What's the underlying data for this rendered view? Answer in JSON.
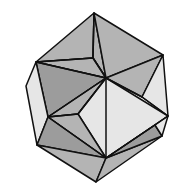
{
  "diagram": {
    "type": "polyhedron-line-drawing",
    "colors": {
      "background": "#ffffff",
      "stroke": "#111111",
      "light_face": "#e6e6e6",
      "mid_face": "#b4b4b4",
      "dark_face": "#9c9c9c"
    },
    "vertices": {
      "T": [
        94,
        13
      ],
      "IU": [
        93,
        58
      ],
      "LU": [
        36,
        62
      ],
      "RU": [
        163,
        55
      ],
      "C": [
        106,
        78
      ],
      "FL": [
        26,
        86
      ],
      "IR": [
        142,
        97
      ],
      "LM": [
        48,
        117
      ],
      "IL": [
        78,
        114
      ],
      "R": [
        168,
        116
      ],
      "RL": [
        155,
        125
      ],
      "RB": [
        162,
        136
      ],
      "LL": [
        37,
        145
      ],
      "BC": [
        106,
        158
      ],
      "B": [
        96,
        182
      ]
    },
    "faces": [
      {
        "name": "top-left-face",
        "pts": [
          "T",
          "LU",
          "IU"
        ],
        "shade": "mid_face"
      },
      {
        "name": "top-center-face",
        "pts": [
          "T",
          "IU",
          "C"
        ],
        "shade": "mid_face"
      },
      {
        "name": "top-right-face",
        "pts": [
          "T",
          "C",
          "RU"
        ],
        "shade": "mid_face"
      },
      {
        "name": "upper-left-face",
        "pts": [
          "LU",
          "IU",
          "C"
        ],
        "shade": "mid_face"
      },
      {
        "name": "left-mid-face",
        "pts": [
          "LU",
          "C",
          "LM"
        ],
        "shade": "dark_face"
      },
      {
        "name": "center-left-face",
        "pts": [
          "C",
          "IL",
          "LM"
        ],
        "shade": "mid_face"
      },
      {
        "name": "right-upper-face",
        "pts": [
          "C",
          "RU",
          "IR"
        ],
        "shade": "mid_face"
      },
      {
        "name": "right-side-face",
        "pts": [
          "RU",
          "R",
          "IR"
        ],
        "shade": "light_face"
      },
      {
        "name": "front-square-face",
        "pts": [
          "C",
          "R",
          "BC",
          "IL"
        ],
        "shade": "light_face"
      },
      {
        "name": "far-left-face",
        "pts": [
          "LU",
          "FL",
          "LL",
          "LM"
        ],
        "shade": "light_face"
      },
      {
        "name": "lower-left-face",
        "pts": [
          "LM",
          "IL",
          "BC"
        ],
        "shade": "mid_face"
      },
      {
        "name": "lower-left-outer-face",
        "pts": [
          "LM",
          "BC",
          "LL"
        ],
        "shade": "dark_face"
      },
      {
        "name": "bottom-left-face",
        "pts": [
          "LL",
          "BC",
          "B"
        ],
        "shade": "mid_face"
      },
      {
        "name": "bottom-right-face",
        "pts": [
          "BC",
          "RB",
          "B"
        ],
        "shade": "mid_face"
      },
      {
        "name": "lower-right-face",
        "pts": [
          "BC",
          "RL",
          "RB"
        ],
        "shade": "dark_face"
      },
      {
        "name": "right-lower-face",
        "pts": [
          "R",
          "RB",
          "RL"
        ],
        "shade": "light_face"
      }
    ],
    "edges": [
      [
        "T",
        "IU"
      ],
      [
        "IU",
        "C"
      ],
      [
        "LU",
        "IU"
      ],
      [
        "C",
        "LU"
      ],
      [
        "C",
        "LM"
      ],
      [
        "C",
        "IL"
      ],
      [
        "C",
        "BC"
      ],
      [
        "IL",
        "LM"
      ],
      [
        "LM",
        "BC"
      ],
      [
        "IR",
        "R"
      ],
      [
        "IR",
        "C"
      ],
      [
        "RL",
        "BC"
      ],
      [
        "R",
        "BC"
      ]
    ]
  }
}
